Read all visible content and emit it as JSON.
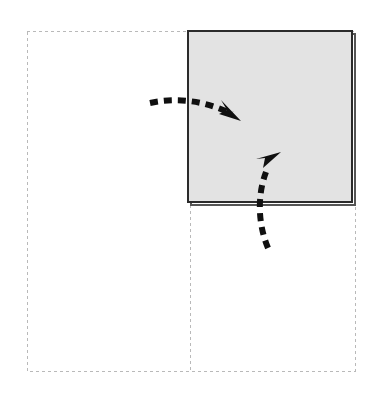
{
  "canvas": {
    "width": 368,
    "height": 399,
    "background_color": "#ffffff",
    "title": "Panel Placement Diagram"
  },
  "colors": {
    "background": "#ffffff",
    "dashed_outline": "#b9b9b9",
    "panel_fill": "#e3e3e3",
    "panel_border": "#2b2b2b",
    "panel_shadow": "#555555",
    "arrow": "#101010"
  },
  "outline_region": {
    "name": "dashed-boundary",
    "x": 27,
    "y": 31,
    "width": 328,
    "height": 340,
    "stroke_color": "#b9b9b9",
    "stroke_width": 1,
    "dash_pattern": "3 3",
    "fill": "none"
  },
  "divider": {
    "name": "vertical-dashed-divider",
    "x": 190,
    "y_start": 31,
    "y_end": 371,
    "stroke_color": "#b9b9b9",
    "stroke_width": 1,
    "dash_pattern": "3 3"
  },
  "panel": {
    "name": "gray-panel",
    "x": 188,
    "y": 31,
    "width": 164,
    "height": 171,
    "fill": "#e3e3e3",
    "border_color": "#2b2b2b",
    "border_width": 2,
    "shadow_color": "#555555",
    "shadow_offset_x": 3,
    "shadow_offset_y": 3
  },
  "arrows": [
    {
      "name": "arrow-from-left",
      "direction": "down-right",
      "tail_x": 150,
      "tail_y": 103,
      "tip_x": 241,
      "tip_y": 121,
      "path": "M150,103 C178,97 206,101 232,114",
      "stroke_color": "#101010",
      "stroke_width": 6,
      "dash_pattern": "8 6",
      "head_size": 15
    },
    {
      "name": "arrow-from-below",
      "direction": "up-right",
      "tail_x": 268,
      "tail_y": 248,
      "tip_x": 281,
      "tip_y": 152,
      "path": "M268,248 C258,224 257,196 266,172",
      "stroke_color": "#101010",
      "stroke_width": 6,
      "dash_pattern": "8 6",
      "head_size": 15
    }
  ]
}
